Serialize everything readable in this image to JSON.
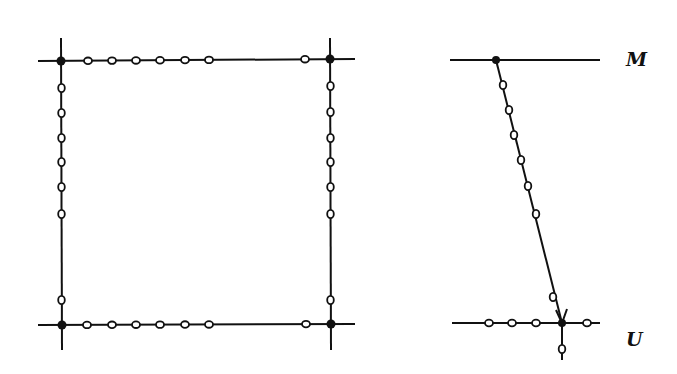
{
  "figure": {
    "left_panel": {
      "description": "square lattice cell with 4 filled corner nodes and open circles along edges",
      "corner_nodes": [
        [
          61,
          61
        ],
        [
          330,
          59
        ],
        [
          62,
          325
        ],
        [
          331,
          324
        ]
      ],
      "top_edge_circles_x": [
        88,
        112,
        136,
        160,
        185,
        209,
        305
      ],
      "bottom_edge_circles_x": [
        87,
        112,
        136,
        160,
        185,
        209,
        306
      ],
      "left_edge_circles_y": [
        88,
        113,
        138,
        162,
        187,
        214,
        300
      ],
      "right_edge_circles_y": [
        86,
        112,
        138,
        162,
        187,
        214,
        300
      ]
    },
    "right_panel": {
      "description": "two horizontal lines with a diagonal arrow connecting top node to bottom node",
      "top_line_label": "M",
      "bottom_line_label": "U",
      "top_node": [
        496,
        60
      ],
      "bottom_node": [
        562,
        323
      ],
      "diagonal_circles": [
        [
          503,
          85
        ],
        [
          509,
          110
        ],
        [
          514,
          135
        ],
        [
          521,
          160
        ],
        [
          528,
          186
        ],
        [
          536,
          214
        ],
        [
          553,
          297
        ]
      ],
      "bottom_line_circles_x": [
        489,
        512,
        536,
        587
      ],
      "below_circle": [
        562,
        349
      ]
    },
    "colors": {
      "ink": "#111111",
      "background": "#ffffff"
    }
  }
}
